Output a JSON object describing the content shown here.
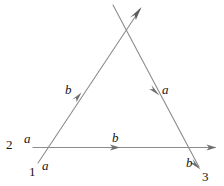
{
  "figure": {
    "background_color": "#ffffff",
    "stroke_color": "#8c8c8c",
    "label_color": "#151515",
    "width": 224,
    "height": 186,
    "vertices": [
      {
        "id": "vertex-1",
        "label": "1",
        "x": 33,
        "y": 172
      },
      {
        "id": "vertex-2",
        "label": "2",
        "x": 10,
        "y": 145
      },
      {
        "id": "vertex-3",
        "label": "3",
        "x": 206,
        "y": 177
      }
    ],
    "edge_labels": [
      {
        "id": "edge-a-upper",
        "label": "a",
        "x": 28,
        "y": 139
      },
      {
        "id": "edge-a-lower",
        "label": "a",
        "x": 46,
        "y": 166
      },
      {
        "id": "edge-b-left",
        "label": "b",
        "x": 69,
        "y": 90
      },
      {
        "id": "edge-a-right",
        "label": "a",
        "x": 166,
        "y": 90
      },
      {
        "id": "edge-b-base",
        "label": "b",
        "x": 116,
        "y": 138
      },
      {
        "id": "edge-b-right",
        "label": "b",
        "x": 190,
        "y": 163
      }
    ],
    "strokes": {
      "base_line": {
        "x1": 33,
        "y1": 147,
        "x2": 215,
        "y2": 147
      },
      "left_leg": {
        "x1": 38,
        "y1": 163,
        "x2": 141,
        "y2": 8
      },
      "right_leg": {
        "x1": 113,
        "y1": 5,
        "x2": 200,
        "y2": 168
      }
    },
    "arrow_markers": [
      {
        "id": "arrow-base-mid",
        "x": 117,
        "y": 147,
        "direction": "right"
      },
      {
        "id": "arrow-base-end",
        "x": 215,
        "y": 147,
        "direction": "right"
      },
      {
        "id": "arrow-left-leg",
        "x": 79,
        "y": 96,
        "direction": "up-right"
      },
      {
        "id": "arrow-apex-tip",
        "x": 141,
        "y": 8,
        "direction": "up-right"
      },
      {
        "id": "arrow-right-leg",
        "x": 157,
        "y": 88,
        "direction": "down-right"
      },
      {
        "id": "arrow-right-end",
        "x": 200,
        "y": 168,
        "direction": "down-right"
      }
    ]
  }
}
